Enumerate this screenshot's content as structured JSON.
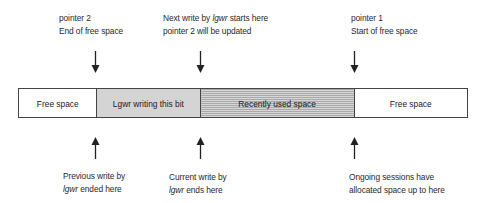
{
  "diagram": {
    "title": "",
    "top_annotations": [
      {
        "id": "pointer2",
        "lines": [
          "pointer 2",
          "End of free space"
        ],
        "arrow": "down"
      },
      {
        "id": "next-write",
        "line1_prefix": "Next write by ",
        "line1_italic": "lgwr",
        "line1_suffix": " starts here",
        "line2": "pointer 2 will be updated",
        "arrow": "down"
      },
      {
        "id": "pointer1",
        "lines": [
          "pointer 1",
          "Start of free space"
        ],
        "arrow": "down"
      }
    ],
    "bar_segments": [
      {
        "id": "free-left",
        "label": "Free space",
        "fill": "#ffffff",
        "pattern": "none"
      },
      {
        "id": "lgwr-writing",
        "label": "Lgwr writing this bit",
        "fill": "#d4d4d4",
        "pattern": "solid-gray"
      },
      {
        "id": "recently-used",
        "label": "Recently used space",
        "fill": "#c8c8c8",
        "pattern": "horizontal-stripes"
      },
      {
        "id": "free-right",
        "label": "Free space",
        "fill": "#ffffff",
        "pattern": "none"
      }
    ],
    "bottom_annotations": [
      {
        "id": "previous-write",
        "line1": "Previous write by",
        "line2_italic": "lgwr",
        "line2_suffix": " ended here",
        "arrow": "up"
      },
      {
        "id": "current-write",
        "line1": "Current write by",
        "line2_italic": "lgwr",
        "line2_suffix": " ends here",
        "arrow": "up"
      },
      {
        "id": "ongoing-sessions",
        "lines": [
          "Ongoing sessions have",
          "allocated space up to here"
        ],
        "arrow": "up"
      }
    ],
    "colors": {
      "border": "#444444",
      "text": "#222222",
      "lgwr_fill": "#d4d4d4",
      "recent_fill": "#c8c8c8"
    }
  }
}
